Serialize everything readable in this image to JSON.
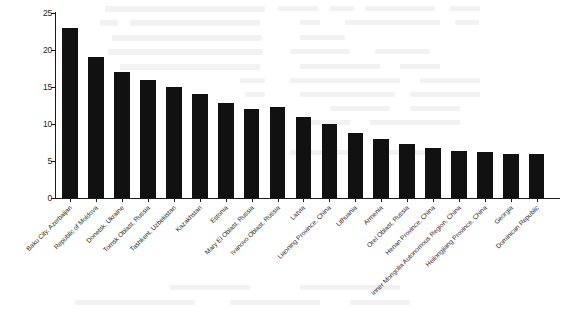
{
  "chart_data": {
    "type": "bar",
    "title": "",
    "subtitle": "",
    "xlabel": "",
    "ylabel": "",
    "ylim": [
      0,
      25
    ],
    "yticks": [
      0,
      5,
      10,
      15,
      20,
      25
    ],
    "grid": false,
    "legend": null,
    "bar_color": "#111111",
    "axis_color": "#1a1a1a",
    "label_rotation": -45,
    "categories": [
      "Baku City, Azerbaijan",
      "Republic of Moldova",
      "Donetsk, Ukraine",
      "Tomsk Oblast, Russia",
      "Tashkent, Uzbekistan",
      "Kazakhstan",
      "Estonia",
      "Mary El Oblast, Russia",
      "Ivanovo Oblast, Russia",
      "Latvia",
      "Liaoning Province, China",
      "Lithuania",
      "Armenia",
      "Orel Oblast, Russia",
      "Henan Province, China",
      "Inner Mongolia Autonomous Region, China",
      "Heilongjiang Province, China",
      "Georgia",
      "Dominican Republic"
    ],
    "values": [
      23,
      19,
      17,
      16,
      15,
      14,
      12.8,
      12,
      12.3,
      11,
      10,
      8.8,
      8,
      7.3,
      6.7,
      6.4,
      6.2,
      6,
      6
    ]
  }
}
